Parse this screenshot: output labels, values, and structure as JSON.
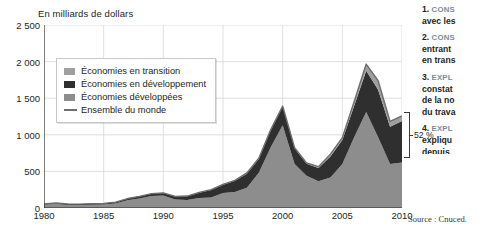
{
  "chart_data": {
    "type": "area",
    "stacked": true,
    "title": "En milliards de dollars",
    "xlabel": "",
    "ylabel": "",
    "ylim": [
      0,
      2500
    ],
    "yticks": [
      0,
      500,
      1000,
      1500,
      2000,
      2500
    ],
    "ytick_labels": [
      "0",
      "500",
      "1 000",
      "1 500",
      "2 000",
      "2 500"
    ],
    "xlim": [
      1980,
      2010
    ],
    "xticks": [
      1980,
      1985,
      1990,
      1995,
      2000,
      2005,
      2010
    ],
    "xtick_labels": [
      "1980",
      "1985",
      "1990",
      "1995",
      "2000",
      "2005",
      "2010"
    ],
    "x": [
      1980,
      1981,
      1982,
      1983,
      1984,
      1985,
      1986,
      1987,
      1988,
      1989,
      1990,
      1991,
      1992,
      1993,
      1994,
      1995,
      1996,
      1997,
      1998,
      1999,
      2000,
      2001,
      2002,
      2003,
      2004,
      2005,
      2006,
      2007,
      2008,
      2009,
      2010
    ],
    "grid": true,
    "legend_position": "upper-left",
    "series": [
      {
        "name": "Économies développées",
        "color": "#8d8d8d",
        "values": [
          47,
          56,
          40,
          40,
          45,
          47,
          63,
          105,
          130,
          165,
          170,
          115,
          110,
          135,
          145,
          205,
          220,
          275,
          480,
          830,
          1130,
          600,
          440,
          365,
          415,
          600,
          970,
          1310,
          965,
          600,
          620
        ]
      },
      {
        "name": "Économies en développement",
        "color": "#2f2f2f",
        "values": [
          8,
          12,
          14,
          13,
          15,
          16,
          17,
          24,
          29,
          30,
          35,
          41,
          50,
          73,
          100,
          113,
          152,
          193,
          191,
          232,
          256,
          215,
          163,
          180,
          290,
          330,
          430,
          565,
          650,
          510,
          570
        ]
      },
      {
        "name": "Économies en transition",
        "color": "#9f9f9f",
        "values": [
          0,
          0,
          0,
          0,
          0,
          0,
          0,
          0,
          0,
          1,
          2,
          2,
          3,
          6,
          6,
          5,
          6,
          11,
          10,
          9,
          7,
          10,
          12,
          20,
          31,
          31,
          58,
          91,
          123,
          72,
          68
        ]
      }
    ],
    "total_line": {
      "name": "Ensemble du monde",
      "color": "#6e6e6e",
      "values": [
        55,
        68,
        54,
        53,
        60,
        63,
        80,
        129,
        159,
        196,
        207,
        158,
        163,
        214,
        251,
        323,
        378,
        479,
        681,
        1071,
        1393,
        825,
        615,
        565,
        736,
        961,
        1458,
        1966,
        1738,
        1182,
        1258
      ]
    },
    "annotation": {
      "label": "52 %",
      "at_year": 2010,
      "describes": "part des économies développées dans le total mondial en 2010"
    },
    "source": "Source : Cnuced."
  },
  "legend": {
    "items": [
      {
        "label": "Économies en transition",
        "marker": "swatch",
        "color": "#9f9f9f"
      },
      {
        "label": "Économies en développement",
        "marker": "swatch",
        "color": "#2f2f2f"
      },
      {
        "label": "Économies développées",
        "marker": "swatch",
        "color": "#8d8d8d"
      },
      {
        "label": "Ensemble du monde",
        "marker": "line",
        "color": "#6e6e6e"
      }
    ]
  },
  "notes": {
    "items": [
      {
        "num": "1.",
        "head": "CONS",
        "body": "avec les"
      },
      {
        "num": "2.",
        "head": "CONS",
        "body": "entrant\nen trans"
      },
      {
        "num": "3.",
        "head": "EXPL",
        "body": "constat\nde la no\ndu trava"
      },
      {
        "num": "4.",
        "head": "EXPL",
        "body": "expliqu\ndepuis"
      }
    ]
  }
}
